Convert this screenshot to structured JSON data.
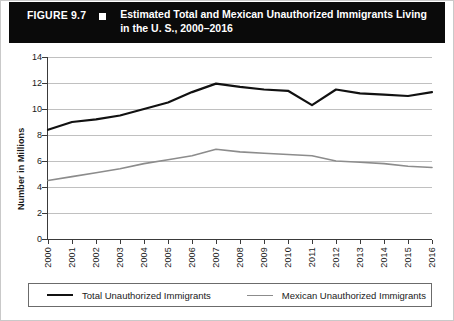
{
  "header": {
    "figure_label": "FIGURE 9.7",
    "bullet_icon": "square-bullet-icon",
    "title": "Estimated Total and Mexican Unauthorized Immigrants Living in the U. S., 2000–2016",
    "background_color": "#0a0a0a",
    "text_color": "#ffffff"
  },
  "chart_data": {
    "type": "line",
    "title": "Estimated Total and Mexican Unauthorized Immigrants Living in the U. S., 2000–2016",
    "xlabel": "",
    "ylabel": "Number in Millions",
    "x": [
      "2000",
      "2001",
      "2002",
      "2003",
      "2004",
      "2005",
      "2006",
      "2007",
      "2008",
      "2009",
      "2010",
      "2011",
      "2012",
      "2013",
      "2014",
      "2015",
      "2016"
    ],
    "categories": [
      "2000",
      "2001",
      "2002",
      "2003",
      "2004",
      "2005",
      "2006",
      "2007",
      "2008",
      "2009",
      "2010",
      "2011",
      "2012",
      "2013",
      "2014",
      "2015",
      "2016"
    ],
    "series": [
      {
        "name": "Total Unauthorized Immigrants",
        "color": "#111111",
        "values": [
          8.4,
          9.0,
          9.2,
          9.5,
          10.0,
          10.5,
          11.3,
          11.95,
          11.7,
          11.5,
          11.4,
          10.3,
          11.5,
          11.2,
          11.1,
          11.0,
          11.3
        ]
      },
      {
        "name": "Mexican Unauthorized Immigrants",
        "color": "#8c8c8c",
        "values": [
          4.5,
          4.8,
          5.1,
          5.4,
          5.8,
          6.1,
          6.4,
          6.9,
          6.7,
          6.6,
          6.5,
          6.4,
          6.0,
          5.9,
          5.8,
          5.6,
          5.5
        ]
      }
    ],
    "ylim": [
      0,
      14
    ],
    "yticks": [
      0,
      2,
      4,
      6,
      8,
      10,
      12,
      14
    ],
    "ytick_labels": [
      "0",
      "2",
      "4",
      "6",
      "8",
      "10",
      "12",
      "14"
    ],
    "grid": true,
    "grid_axis": "y",
    "grid_color": "#c0c0c0",
    "legend_position": "bottom"
  },
  "legend": {
    "entries": [
      {
        "label": "Total Unauthorized Immigrants",
        "swatch": "black-line-swatch"
      },
      {
        "label": "Mexican Unauthorized Immigrants",
        "swatch": "gray-line-swatch"
      }
    ]
  }
}
